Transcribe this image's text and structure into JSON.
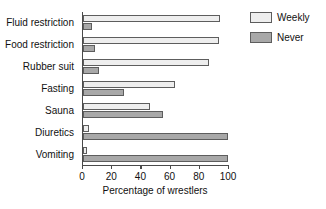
{
  "chart_data": {
    "type": "bar",
    "orientation": "horizontal",
    "title": "",
    "xlabel": "Percentage of wrestlers",
    "ylabel": "",
    "xlim": [
      0,
      100
    ],
    "xticks": [
      0,
      20,
      40,
      60,
      80,
      100
    ],
    "grid": false,
    "legend_position": "right",
    "categories": [
      "Fluid restriction",
      "Food restriction",
      "Rubber suit",
      "Fasting",
      "Sauna",
      "Diuretics",
      "Vomiting"
    ],
    "series": [
      {
        "name": "Weekly",
        "color": "#eeeeee",
        "values": [
          94,
          93,
          86,
          63,
          46,
          4,
          3
        ]
      },
      {
        "name": "Never",
        "color": "#a8a8a8",
        "values": [
          6,
          8,
          11,
          28,
          55,
          99,
          99
        ]
      }
    ]
  },
  "legend": {
    "items": [
      {
        "label": "Weekly"
      },
      {
        "label": "Never"
      }
    ]
  }
}
